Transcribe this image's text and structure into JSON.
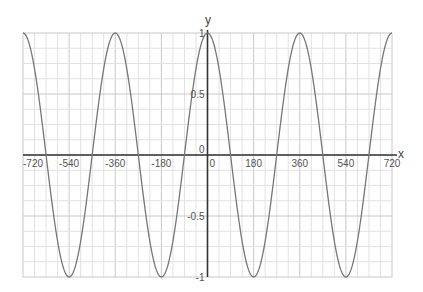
{
  "chart_data": {
    "type": "line",
    "title": "",
    "xlabel": "x",
    "ylabel": "y",
    "xlim": [
      -720,
      720
    ],
    "ylim": [
      -1,
      1
    ],
    "grid": true,
    "x_ticks": [
      -720,
      -540,
      -360,
      -180,
      0,
      180,
      360,
      540,
      720
    ],
    "x_tick_labels": [
      "-720",
      "-540",
      "-360",
      "-180",
      "0",
      "180",
      "360",
      "540",
      "720"
    ],
    "y_ticks": [
      -1,
      -0.5,
      0,
      0.5,
      1
    ],
    "y_tick_labels": [
      "-1",
      "-0.5",
      "0",
      "0.5",
      "1"
    ],
    "series": [
      {
        "name": "y = cos(x)",
        "function": "cos(x degrees)",
        "x": [
          -720,
          -630,
          -540,
          -450,
          -360,
          -270,
          -180,
          -90,
          0,
          90,
          180,
          270,
          360,
          450,
          540,
          630,
          720
        ],
        "values": [
          1,
          0,
          -1,
          0,
          1,
          0,
          -1,
          0,
          1,
          0,
          -1,
          0,
          1,
          0,
          -1,
          0,
          1
        ],
        "color": "#777777"
      }
    ]
  },
  "colors": {
    "grid_major": "#c8c8c8",
    "grid_minor": "#e2e2e2",
    "axis": "#333333",
    "curve": "#777777"
  }
}
